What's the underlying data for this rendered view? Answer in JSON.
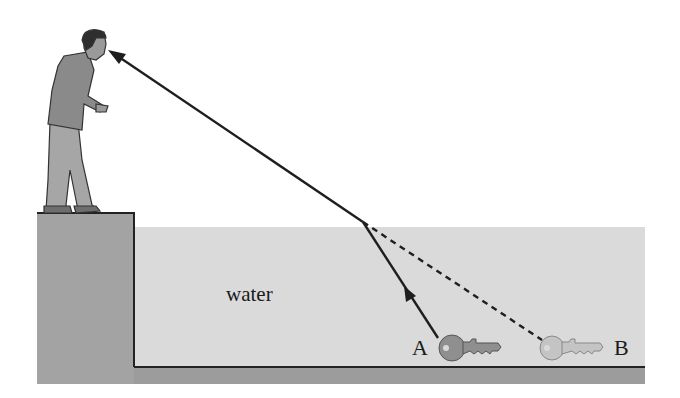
{
  "diagram": {
    "labels": {
      "medium": "water",
      "real_object": "A",
      "apparent_object": "B"
    },
    "elements": {
      "observer": "person standing on ledge looking down into water",
      "ledge": "raised platform on left",
      "water": "water-filled basin",
      "key_a": "actual key position (A)",
      "key_b": "apparent key image (B)",
      "refracted_ray": "solid ray from key A to surface, bending at surface toward eye",
      "virtual_ray": "dashed line extending straight back from surface to apparent image B"
    },
    "colors": {
      "background": "#ffffff",
      "water": "#dadada",
      "ledge": "#a3a3a3",
      "floor": "#9c9c9c",
      "outline": "#222222",
      "ray": "#1e1e1e",
      "key_a": "#8f8f8f",
      "key_b": "#c4c4c4",
      "person_shirt": "#8a8a8a",
      "person_pants": "#a6a6a6",
      "hair": "#2e2e2e"
    }
  }
}
